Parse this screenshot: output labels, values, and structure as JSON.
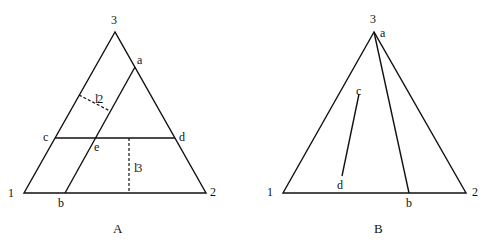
{
  "diagram_a": {
    "caption": "A",
    "vertices": {
      "v1": "1",
      "v2": "2",
      "v3": "3"
    },
    "points": {
      "a": "a",
      "b": "b",
      "c": "c",
      "d": "d",
      "e": "e"
    },
    "distances": {
      "l2_main": "l",
      "l2_sub": "2",
      "l3_main": "l",
      "l3_sub": "3"
    }
  },
  "diagram_b": {
    "caption": "B",
    "vertices": {
      "v1": "1",
      "v2": "2",
      "v3": "3"
    },
    "points": {
      "a": "a",
      "b": "b",
      "c": "c",
      "d": "d"
    }
  }
}
